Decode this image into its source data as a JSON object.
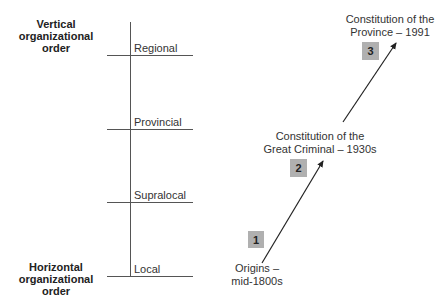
{
  "axis": {
    "top_title": "Vertical organizational order",
    "top_title_lines": [
      "Vertical",
      "organizational",
      "order"
    ],
    "bottom_title": "Horizontal organizational order",
    "bottom_title_lines": [
      "Horizontal",
      "organizational",
      "order"
    ]
  },
  "levels": [
    {
      "label": "Regional"
    },
    {
      "label": "Provincial"
    },
    {
      "label": "Supralocal"
    },
    {
      "label": "Local"
    }
  ],
  "stages": [
    {
      "number": "1",
      "label_lines": [
        "Origins –",
        "mid-1800s"
      ]
    },
    {
      "number": "2",
      "label_lines": [
        "Constitution of the",
        "Great Criminal – 1930s"
      ]
    },
    {
      "number": "3",
      "label_lines": [
        "Constitution of the",
        "Province – 1991"
      ]
    }
  ],
  "colors": {
    "box_fill": "#b0b0b0",
    "line": "#555555",
    "arrow": "#222222"
  }
}
